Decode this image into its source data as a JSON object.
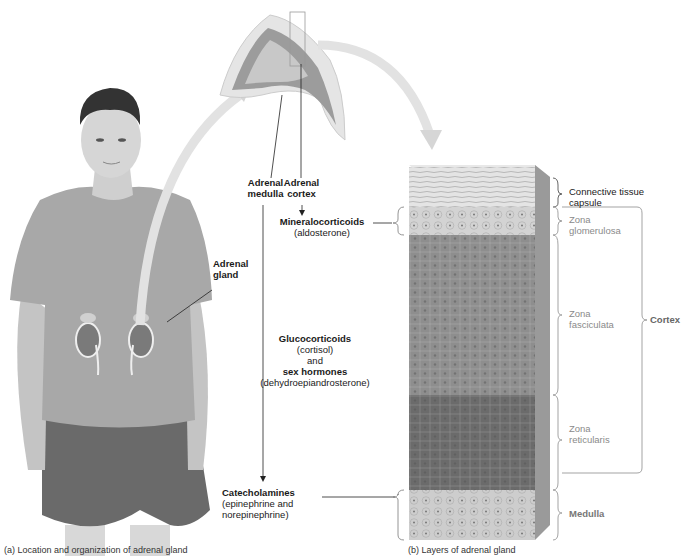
{
  "labels": {
    "adrenal_gland": [
      "Adrenal",
      "gland"
    ],
    "adrenal_medulla": [
      "Adrenal",
      "medulla"
    ],
    "adrenal_cortex": [
      "Adrenal",
      "cortex"
    ],
    "mineralocorticoids": {
      "title": "Mineralocorticoids",
      "example": "(aldosterone)"
    },
    "glucocorticoids": {
      "title": "Glucocorticoids",
      "example": "(cortisol)",
      "conj": "and",
      "title2": "sex hormones",
      "example2": "(dehydroepiandrosterone)"
    },
    "catecholamines": {
      "title": "Catecholamines",
      "example": [
        "(epinephrine and",
        "norepinephrine)"
      ]
    }
  },
  "layers": [
    {
      "name": "Connective tissue capsule",
      "lines": [
        "Connective tissue",
        "capsule"
      ],
      "style": "dark"
    },
    {
      "name": "Zona glomerulosa",
      "lines": [
        "Zona",
        "glomerulosa"
      ],
      "style": "grey"
    },
    {
      "name": "Zona fasciculata",
      "lines": [
        "Zona",
        "fasciculata"
      ],
      "style": "grey"
    },
    {
      "name": "Zona reticularis",
      "lines": [
        "Zona",
        "reticularis"
      ],
      "style": "grey"
    },
    {
      "name": "Medulla",
      "lines": [
        "Medulla"
      ],
      "style": "bold-grey"
    }
  ],
  "group_label": "Cortex",
  "captions": {
    "left": "(a) Location and organization of adrenal gland",
    "right": "(b) Layers of adrenal gland"
  },
  "colors": {
    "capsule": "#d9d9d9",
    "glomerulosa": "#cfcfcf",
    "fasciculata": "#8f8f8f",
    "reticularis": "#6e6e6e",
    "medulla": "#c8c8c8",
    "arrow": "#dcdcdc"
  }
}
